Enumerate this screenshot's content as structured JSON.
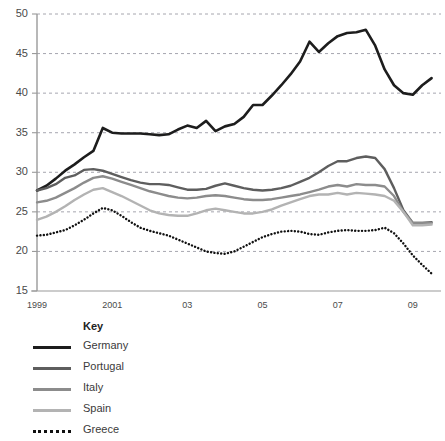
{
  "chart_data": {
    "type": "line",
    "title": "",
    "xlabel": "",
    "ylabel": "",
    "ylim": [
      15,
      50
    ],
    "xlim": [
      1999,
      2009.75
    ],
    "yticks": [
      15,
      20,
      25,
      30,
      35,
      40,
      45,
      50
    ],
    "xticks": [
      1999,
      2001,
      2003,
      2005,
      2007,
      2009
    ],
    "xticklabels": [
      "1999",
      "2001",
      "03",
      "05",
      "07",
      "09"
    ],
    "grid": true,
    "grid_style": "dashed-horizontal",
    "legend_position": "below-left",
    "legend_title": "Key",
    "x": [
      1999,
      1999.25,
      1999.5,
      1999.75,
      2000,
      2000.25,
      2000.5,
      2000.75,
      2001,
      2001.25,
      2001.5,
      2001.75,
      2002,
      2002.25,
      2002.5,
      2002.75,
      2003,
      2003.25,
      2003.5,
      2003.75,
      2004,
      2004.25,
      2004.5,
      2004.75,
      2005,
      2005.25,
      2005.5,
      2005.75,
      2006,
      2006.25,
      2006.5,
      2006.75,
      2007,
      2007.25,
      2007.5,
      2007.75,
      2008,
      2008.25,
      2008.5,
      2008.75,
      2009,
      2009.25,
      2009.5
    ],
    "series": [
      {
        "name": "Germany",
        "color": "#1d1d1d",
        "width": 2.6,
        "dash": "solid",
        "values": [
          27.7,
          28.3,
          29.2,
          30.2,
          31.0,
          31.9,
          32.7,
          35.6,
          35.0,
          34.9,
          34.9,
          34.9,
          34.8,
          34.7,
          34.8,
          35.4,
          35.9,
          35.6,
          36.5,
          35.2,
          35.8,
          36.1,
          37.0,
          38.5,
          38.5,
          39.7,
          41.0,
          42.4,
          44.0,
          46.5,
          45.2,
          46.3,
          47.2,
          47.6,
          47.7,
          48.0,
          46.0,
          43.0,
          41.0,
          40.0,
          39.8,
          41.0,
          41.9
        ]
      },
      {
        "name": "Portugal",
        "color": "#5e5e5e",
        "width": 2.4,
        "dash": "solid",
        "values": [
          27.7,
          28.0,
          28.5,
          29.3,
          29.6,
          30.3,
          30.4,
          30.2,
          29.8,
          29.4,
          29.0,
          28.7,
          28.5,
          28.5,
          28.4,
          28.1,
          27.8,
          27.8,
          27.9,
          28.3,
          28.6,
          28.3,
          28.0,
          27.8,
          27.7,
          27.8,
          28.0,
          28.3,
          28.8,
          29.3,
          30.0,
          30.8,
          31.4,
          31.4,
          31.8,
          32.0,
          31.8,
          30.4,
          28.0,
          25.2,
          23.6,
          23.6,
          23.7
        ]
      },
      {
        "name": "Italy",
        "color": "#8c8c8c",
        "width": 2.4,
        "dash": "solid",
        "values": [
          26.2,
          26.4,
          26.8,
          27.4,
          28.0,
          28.7,
          29.3,
          29.5,
          29.2,
          28.8,
          28.4,
          28.0,
          27.6,
          27.3,
          27.0,
          26.8,
          26.7,
          26.8,
          27.0,
          27.1,
          27.0,
          26.8,
          26.6,
          26.5,
          26.5,
          26.6,
          26.8,
          27.0,
          27.2,
          27.5,
          27.8,
          28.2,
          28.4,
          28.2,
          28.5,
          28.4,
          28.4,
          28.2,
          27.0,
          25.0,
          23.6,
          23.6,
          23.6
        ]
      },
      {
        "name": "Spain",
        "color": "#b3b3b3",
        "width": 2.4,
        "dash": "solid",
        "values": [
          24.0,
          24.4,
          25.0,
          25.7,
          26.5,
          27.2,
          27.8,
          28.0,
          27.5,
          27.0,
          26.4,
          25.8,
          25.2,
          24.8,
          24.6,
          24.5,
          24.5,
          24.8,
          25.2,
          25.4,
          25.2,
          25.0,
          24.8,
          24.8,
          25.0,
          25.3,
          25.8,
          26.2,
          26.6,
          27.0,
          27.2,
          27.2,
          27.4,
          27.2,
          27.4,
          27.3,
          27.2,
          27.0,
          26.4,
          25.0,
          23.3,
          23.3,
          23.4
        ]
      },
      {
        "name": "Greece",
        "color": "#111111",
        "width": 2.4,
        "dash": "dotted",
        "values": [
          22.0,
          22.1,
          22.4,
          22.7,
          23.3,
          24.0,
          24.8,
          25.5,
          25.2,
          24.5,
          23.7,
          23.0,
          22.6,
          22.3,
          22.0,
          21.5,
          21.0,
          20.5,
          20.0,
          19.8,
          19.7,
          20.0,
          20.6,
          21.2,
          21.8,
          22.2,
          22.5,
          22.6,
          22.5,
          22.2,
          22.1,
          22.4,
          22.6,
          22.7,
          22.6,
          22.6,
          22.7,
          23.0,
          22.3,
          21.0,
          19.5,
          18.3,
          17.2
        ]
      }
    ]
  },
  "legend": {
    "title": "Key",
    "items": [
      {
        "label": "Germany"
      },
      {
        "label": "Portugal"
      },
      {
        "label": "Italy"
      },
      {
        "label": "Spain"
      },
      {
        "label": "Greece"
      }
    ]
  },
  "axes": {
    "y_labels": [
      "50",
      "45",
      "40",
      "35",
      "30",
      "25",
      "20",
      "15"
    ],
    "x_labels": [
      "1999",
      "2001",
      "03",
      "05",
      "07",
      "09"
    ]
  },
  "colors": {
    "axis": "#9a9a9a",
    "grid": "#8f8f9a",
    "text": "#4a4a4a",
    "germany": "#1d1d1d",
    "portugal": "#5e5e5e",
    "italy": "#8c8c8c",
    "spain": "#b3b3b3",
    "greece": "#111111"
  }
}
